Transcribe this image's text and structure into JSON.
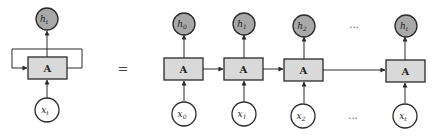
{
  "diagram": {
    "colors": {
      "output_fill": "#a8a8a8",
      "input_fill": "#ffffff",
      "box_fill": "#d9d9d9",
      "stroke": "#2a2a2a"
    },
    "folded": {
      "output": {
        "base": "h",
        "sub": "t"
      },
      "cell": "A",
      "input": {
        "base": "x",
        "sub": "t"
      }
    },
    "equals": "=",
    "unrolled": {
      "steps": [
        {
          "output": {
            "base": "h",
            "sub": "0"
          },
          "cell": "A",
          "input": {
            "base": "x",
            "sub": "0"
          }
        },
        {
          "output": {
            "base": "h",
            "sub": "1"
          },
          "cell": "A",
          "input": {
            "base": "x",
            "sub": "1"
          }
        },
        {
          "output": {
            "base": "h",
            "sub": "2"
          },
          "cell": "A",
          "input": {
            "base": "x",
            "sub": "2"
          }
        },
        {
          "output": {
            "base": "h",
            "sub": "t"
          },
          "cell": "A",
          "input": {
            "base": "x",
            "sub": "t"
          }
        }
      ],
      "ellipsis_top": "...",
      "ellipsis_bottom": "..."
    }
  }
}
